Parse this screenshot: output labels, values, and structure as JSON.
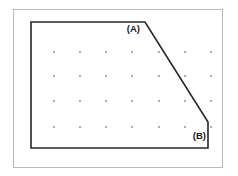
{
  "figure": {
    "background_color": "#ffffff",
    "outer_frame": {
      "name": "outer-frame",
      "x": 13,
      "y": 9,
      "width": 209,
      "height": 158,
      "stroke_color": "#b8b8b8",
      "stroke_width": 1,
      "fill_color": "#ffffff"
    },
    "polygon": {
      "name": "chamfered-rectangle",
      "points": "31,22 145,22 208,122 208,148 31,148",
      "stroke_color": "#262626",
      "stroke_width": 1.6,
      "fill_color": "none",
      "vertices": [
        {
          "id": "top-left",
          "x": 31,
          "y": 22
        },
        {
          "id": "A",
          "x": 145,
          "y": 22
        },
        {
          "id": "B",
          "x": 208,
          "y": 122
        },
        {
          "id": "bottom-right",
          "x": 208,
          "y": 148
        },
        {
          "id": "bottom-left",
          "x": 31,
          "y": 148
        }
      ]
    },
    "labels": [
      {
        "id": "label-a",
        "text": "(A)",
        "x": 140,
        "y": 32,
        "anchor": "end"
      },
      {
        "id": "label-b",
        "text": "(B)",
        "x": 206,
        "y": 139,
        "anchor": "end"
      }
    ],
    "dot_grid": {
      "name": "dot-grid",
      "dot_color": "#5a5a5a",
      "dot_size": 1.4,
      "columns": [
        54,
        80,
        106,
        132,
        159,
        185,
        211
      ],
      "rows": [
        52,
        76,
        101,
        127
      ]
    }
  }
}
